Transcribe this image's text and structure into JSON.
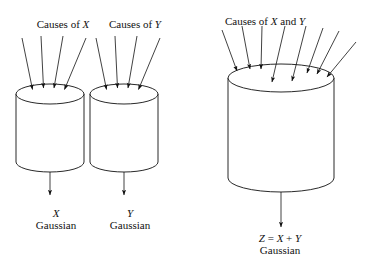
{
  "figure": {
    "type": "diagram",
    "background_color": "#ffffff",
    "stroke_color": "#111111"
  },
  "labels": {
    "causes_x": "Causes of ",
    "causes_x_var": "X",
    "causes_y": "Causes of ",
    "causes_y_var": "Y",
    "causes_xy_pre": "Causes of ",
    "causes_xy_var1": "X",
    "causes_xy_mid": " and ",
    "causes_xy_var2": "Y",
    "out_x_var": "X",
    "out_x_dist": "Gaussian",
    "out_y_var": "Y",
    "out_y_dist": "Gaussian",
    "out_z_expr_z": "Z",
    "out_z_expr_eq": " = ",
    "out_z_expr_x": "X",
    "out_z_expr_plus": " + ",
    "out_z_expr_y": "Y",
    "out_z_dist": "Gaussian"
  },
  "cylinders": [
    {
      "name": "cylinder-x",
      "cx": 50,
      "top_y": 94,
      "bottom_y": 172,
      "rx": 34,
      "ry": 10,
      "inputs": 4,
      "output": "X"
    },
    {
      "name": "cylinder-y",
      "cx": 124,
      "top_y": 94,
      "bottom_y": 172,
      "rx": 34,
      "ry": 10,
      "inputs": 4,
      "output": "Y"
    },
    {
      "name": "cylinder-z",
      "cx": 281,
      "top_y": 78,
      "bottom_y": 192,
      "rx": 53,
      "ry": 14,
      "inputs": 8,
      "output": "Z = X + Y"
    }
  ],
  "arrows": {
    "cylinder_x_inputs": [
      {
        "x1": 22,
        "y1": 38,
        "x2": 32,
        "y2": 90
      },
      {
        "x1": 40,
        "y1": 36,
        "x2": 43,
        "y2": 88
      },
      {
        "x1": 62,
        "y1": 36,
        "x2": 54,
        "y2": 88
      },
      {
        "x1": 85,
        "y1": 38,
        "x2": 64,
        "y2": 90
      }
    ],
    "cylinder_y_inputs": [
      {
        "x1": 96,
        "y1": 38,
        "x2": 106,
        "y2": 90
      },
      {
        "x1": 114,
        "y1": 36,
        "x2": 117,
        "y2": 88
      },
      {
        "x1": 136,
        "y1": 36,
        "x2": 128,
        "y2": 88
      },
      {
        "x1": 159,
        "y1": 38,
        "x2": 138,
        "y2": 90
      }
    ],
    "cylinder_z_inputs": [
      {
        "x1": 223,
        "y1": 30,
        "x2": 238,
        "y2": 72
      },
      {
        "x1": 243,
        "y1": 26,
        "x2": 250,
        "y2": 70
      },
      {
        "x1": 263,
        "y1": 26,
        "x2": 261,
        "y2": 70
      },
      {
        "x1": 284,
        "y1": 26,
        "x2": 272,
        "y2": 82
      },
      {
        "x1": 305,
        "y1": 26,
        "x2": 292,
        "y2": 80
      },
      {
        "x1": 322,
        "y1": 28,
        "x2": 308,
        "y2": 74
      },
      {
        "x1": 338,
        "y1": 32,
        "x2": 318,
        "y2": 74
      },
      {
        "x1": 352,
        "y1": 42,
        "x2": 327,
        "y2": 76
      }
    ],
    "outputs": [
      {
        "name": "output-arrow-x",
        "x1": 50,
        "y1": 172,
        "x2": 50,
        "y2": 196
      },
      {
        "name": "output-arrow-y",
        "x1": 124,
        "y1": 172,
        "x2": 124,
        "y2": 196
      },
      {
        "name": "output-arrow-z",
        "x1": 281,
        "y1": 192,
        "x2": 281,
        "y2": 228
      }
    ]
  }
}
